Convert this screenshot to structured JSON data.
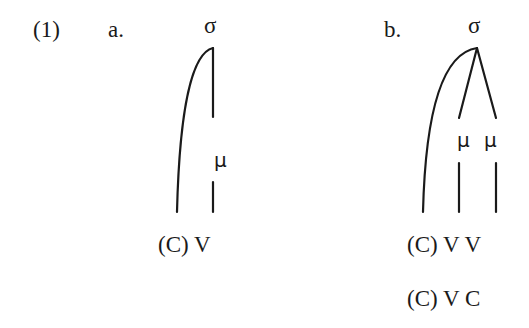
{
  "example": {
    "number": "(1)",
    "a": {
      "label": "a.",
      "root": "σ",
      "mora": [
        "μ"
      ],
      "segments": "(C) V"
    },
    "b": {
      "label": "b.",
      "root": "σ",
      "mora": [
        "μ",
        "μ"
      ],
      "segments_1": "(C) V V",
      "segments_2": "(C) V C"
    }
  }
}
